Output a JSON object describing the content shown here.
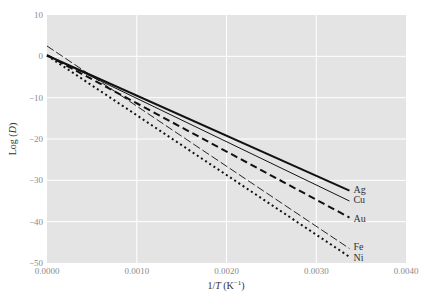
{
  "chart_data": {
    "type": "line",
    "title": "",
    "xlabel": "1/T (K⁻¹)",
    "xlabel_parts": {
      "a": "1/",
      "b": "T",
      "c": " (K",
      "d": "−1",
      "e": ")"
    },
    "ylabel": "Log (D)",
    "ylabel_parts": {
      "a": "Log (",
      "b": "D",
      "c": ")"
    },
    "xlim": [
      0.0,
      0.004
    ],
    "ylim": [
      -50,
      10
    ],
    "xticks": [
      "0.0000",
      "0.0010",
      "0.0020",
      "0.0030",
      "0.0040"
    ],
    "yticks": [
      "10",
      "0",
      "−10",
      "−20",
      "−30",
      "−40",
      "−50"
    ],
    "grid": true,
    "legend_position": "inline labels at right end of lines",
    "series": [
      {
        "name": "Ag",
        "style": "solid-thick",
        "x": [
          0.0,
          0.00337
        ],
        "values": [
          0.2,
          -32.5
        ]
      },
      {
        "name": "Cu",
        "style": "solid-thin",
        "x": [
          0.0,
          0.00337
        ],
        "values": [
          0.3,
          -35.0
        ]
      },
      {
        "name": "Au",
        "style": "dashed-thick",
        "x": [
          0.0,
          0.00337
        ],
        "values": [
          0.3,
          -39.0
        ]
      },
      {
        "name": "Fe",
        "style": "dashed-thin",
        "x": [
          0.0,
          0.00337
        ],
        "values": [
          2.5,
          -46.5
        ]
      },
      {
        "name": "Ni",
        "style": "dotted",
        "x": [
          0.0,
          0.00337
        ],
        "values": [
          0.2,
          -48.5
        ]
      }
    ]
  },
  "colors": {
    "plot_bg": "#e4e4e4",
    "grid": "#ffffff",
    "line": "#111111",
    "tick": "#8a8a8a"
  }
}
